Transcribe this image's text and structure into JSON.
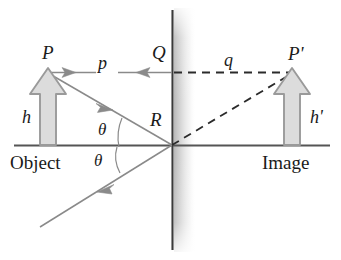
{
  "figure": {
    "type": "optics-ray-diagram",
    "background_color": "#ffffff"
  },
  "labels": {
    "object_tip": "P",
    "image_tip": "P'",
    "mirror_top_point": "Q",
    "mirror_reflection_point": "R",
    "object_distance": "p",
    "image_distance": "q",
    "object_height": "h",
    "image_height": "h'",
    "angle_incidence": "θ",
    "angle_reflection": "θ",
    "object_caption": "Object",
    "image_caption": "Image"
  },
  "colors": {
    "ray": "#8a8a8a",
    "mirror_line": "#3a3a3a",
    "mirror_shade": "#c9c9c9",
    "axis": "#555555",
    "dashed": "#2b2b2b",
    "arrow_fill": "#dcdcdc",
    "arrow_stroke": "#9a9a9a",
    "text": "#1a1a1a"
  },
  "geometry": {
    "mirror_x": 172,
    "axis_y": 145,
    "object_base_x": 48,
    "image_base_x": 292,
    "object_tip_y": 72,
    "ray_horizontal_y": 72
  },
  "icon_names": {
    "object_arrow": "up-block-arrow-icon",
    "image_arrow": "up-block-arrow-icon",
    "incident_ray_arrow": "ray-arrowhead-icon",
    "reflected_ray_arrow": "ray-arrowhead-icon",
    "dimension_arrow_left": "dimension-arrowhead-icon",
    "dimension_arrow_right": "dimension-arrowhead-icon"
  }
}
